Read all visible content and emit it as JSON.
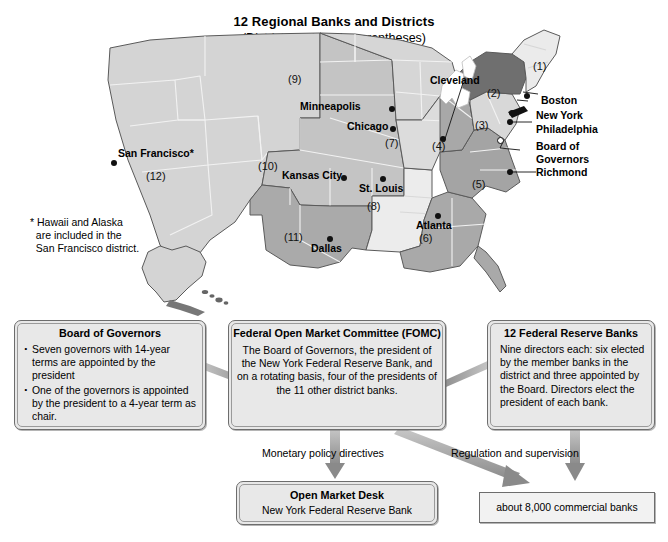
{
  "title": {
    "main": "12 Regional Banks and Districts",
    "sub": "(District numbers in parentheses)"
  },
  "map": {
    "footnote": "* Hawaii and Alaska\n  are included in the\n  San Francisco district.",
    "city_labels": [
      {
        "name": "San Francisco*"
      },
      {
        "name": "Minneapolis"
      },
      {
        "name": "Chicago"
      },
      {
        "name": "Cleveland"
      },
      {
        "name": "Kansas City"
      },
      {
        "name": "St. Louis"
      },
      {
        "name": "Dallas"
      },
      {
        "name": "Atlanta"
      },
      {
        "name": "Boston"
      },
      {
        "name": "New York"
      },
      {
        "name": "Philadelphia"
      },
      {
        "name": "Board of"
      },
      {
        "name": "Governors"
      },
      {
        "name": "Richmond"
      }
    ],
    "district_numbers": [
      {
        "label": "(1)"
      },
      {
        "label": "(2)"
      },
      {
        "label": "(3)"
      },
      {
        "label": "(4)"
      },
      {
        "label": "(5)"
      },
      {
        "label": "(6)"
      },
      {
        "label": "(7)"
      },
      {
        "label": "(8)"
      },
      {
        "label": "(9)"
      },
      {
        "label": "(10)"
      },
      {
        "label": "(11)"
      },
      {
        "label": "(12)"
      }
    ],
    "colors": {
      "district_light": "#d9d9d9",
      "district_mid": "#c0c0c0",
      "district_dark": "#9b9b9b",
      "district_darkest": "#6f6f6f",
      "district_pale": "#eeeeee",
      "border": "#5a5a5a",
      "inner_border": "#f4f4f4"
    }
  },
  "diagram": {
    "board_of_governors": {
      "title": "Board of Governors",
      "bullets": [
        "Seven governors with 14-year terms are appointed by the president",
        "One of the governors is appointed by the president to a 4-year term as chair."
      ]
    },
    "fomc": {
      "title": "Federal Open Market Committee (FOMC)",
      "body": "The Board of Governors, the president of the New York Federal Reserve Bank, and on a rotating basis, four of the presidents of the 11 other district banks."
    },
    "reserve_banks": {
      "title": "12 Federal Reserve Banks",
      "body": "Nine directors each: six elected by the member banks in the district and three appointed by the Board. Directors elect the president of each bank."
    },
    "open_market_desk": {
      "title": "Open Market Desk",
      "body": "New York Federal Reserve Bank"
    },
    "commercial_banks": {
      "body": "about 8,000 commercial banks"
    },
    "arrow_labels": {
      "monetary": "Monetary policy directives",
      "regulation": "Regulation and supervision"
    },
    "colors": {
      "arrow": "#8c8c8c",
      "box_fill": "#e8e8e8",
      "box_border": "#6d6d6d"
    }
  }
}
